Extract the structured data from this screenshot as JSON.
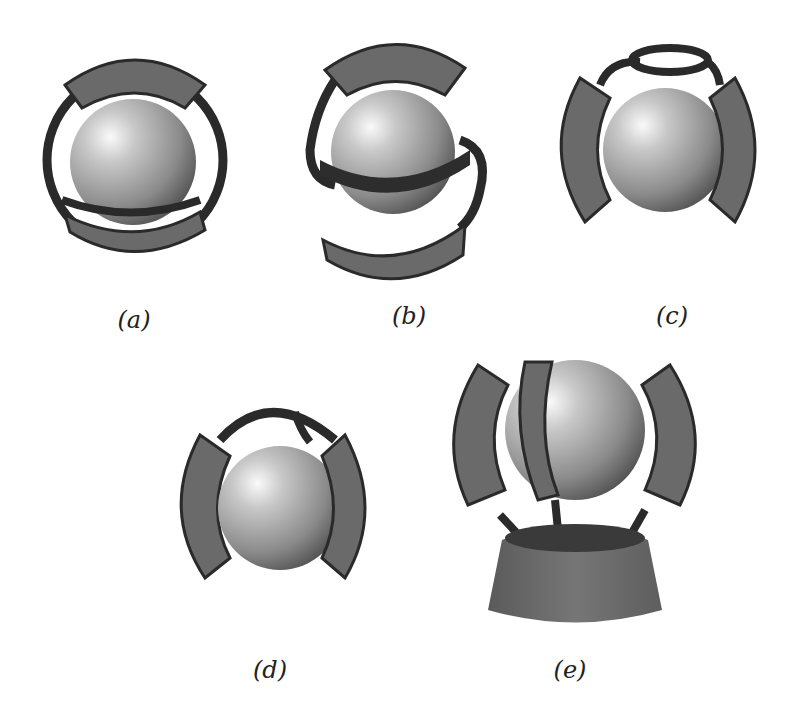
{
  "figure": {
    "panels": [
      {
        "id": "a",
        "label": "(a)",
        "description": "sphere enclosed by a ring frame with top and bottom curved electrode plates"
      },
      {
        "id": "b",
        "label": "(b)",
        "description": "sphere with horizontal belt ring and S-shaped frame holding top and bottom curved plates"
      },
      {
        "id": "c",
        "label": "(c)",
        "description": "sphere with top ring linkage connecting left and right curved plates"
      },
      {
        "id": "d",
        "label": "(d)",
        "description": "sphere with arched linkage connecting left and right curved plates"
      },
      {
        "id": "e",
        "label": "(e)",
        "description": "sphere surrounded by curved plates on struts mounted on a conical base"
      }
    ]
  },
  "colors": {
    "background": "#ffffff",
    "plate": "#6a6a6a",
    "frame": "#2a2a2a",
    "sphere_light": "#f4f4f4",
    "sphere_dark": "#4a4a4a",
    "label": "#222222"
  }
}
